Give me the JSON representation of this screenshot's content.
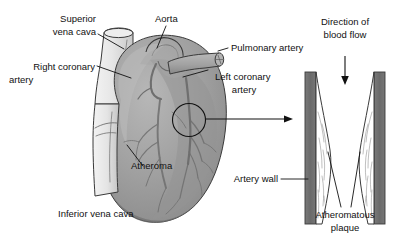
{
  "figure": {
    "background_color": "#ffffff",
    "label_color": "#111111"
  },
  "colors": {
    "heart_body": "#9d9d9d",
    "heart_body_light": "#b4b4b4",
    "heart_shadow": "#7d7d7d",
    "vena_cava": "#e2e2e2",
    "vena_cava_shade": "#cfcfcf",
    "artery_wall": "#6d6d6d",
    "plaque_fill": "#ffffff",
    "outline": "#3a3a3a",
    "leader": "#111111"
  },
  "labels": {
    "superior_vena_cava": "Superior\nvena cava",
    "superior_vena_cava_line1": "Superior",
    "superior_vena_cava_line2": "vena cava",
    "aorta": "Aorta",
    "right_coronary_artery_line1": "Right coronary",
    "right_coronary_artery_line2": "artery",
    "pulmonary_artery": "Pulmonary artery",
    "left_coronary_artery_line1": "Left coronary",
    "left_coronary_artery_line2": "artery",
    "atheroma": "Atheroma",
    "inferior_vena_cava": "Inferior vena cava",
    "direction_of_blood_flow_line1": "Direction of",
    "direction_of_blood_flow_line2": "blood flow",
    "artery_wall": "Artery wall",
    "atheromatous_plaque_line1": "Atheromatous",
    "atheromatous_plaque_line2": "plaque"
  },
  "annotations": {
    "atheroma_circle_marker": "circle-marker",
    "magnify_arrow": "arrow-right",
    "blood_flow_arrow": "arrow-down"
  }
}
